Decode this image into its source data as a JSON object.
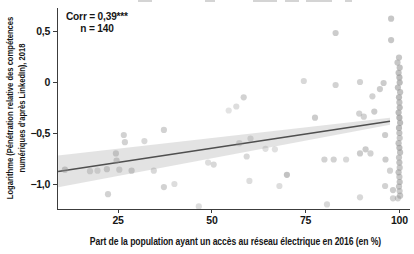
{
  "annotation": {
    "corr_label": "Corr = 0,39***",
    "n_label": "n = 140"
  },
  "axes": {
    "x_title": "Part de la population ayant un accès au réseau électrique en 2016 (en %)",
    "y_title_lines": [
      "Logarithme (Pénétration relative des compétences",
      "numériques d'après LinkedIn), 2018"
    ]
  },
  "chart_data": {
    "type": "scatter",
    "title": "",
    "xlabel": "Part de la population ayant un accès au réseau électrique en 2016 (en %)",
    "ylabel": "Logarithme (Pénétration relative des compétences numériques d'après LinkedIn), 2018",
    "xlim": [
      8.7,
      103.9
    ],
    "ylim": [
      -1.245,
      0.725
    ],
    "x_ticks": [
      25,
      50,
      75,
      100
    ],
    "x_tick_labels": [
      "25",
      "50",
      "75",
      "100"
    ],
    "y_ticks": [
      0.5,
      0,
      -0.5,
      -1
    ],
    "y_tick_labels": [
      "0,5",
      "0",
      "−0,5",
      "−1,0"
    ],
    "grid": false,
    "legend": "none",
    "correlation": "0,39***",
    "n": 140,
    "regression": {
      "x": [
        9,
        97.5
      ],
      "y": [
        -0.877,
        -0.385
      ],
      "band_upper": [
        -0.722,
        -0.35
      ],
      "band_lower": [
        -1.032,
        -0.42
      ]
    },
    "colors": {
      "point": "#8f8f8f",
      "line": "#4f4f4f",
      "band": "#dcdcdc",
      "axis": "#3c3c3c",
      "text": "#161616"
    },
    "points": [
      [
        97.8,
        0.62,
        0.5
      ],
      [
        83,
        0.48,
        0.45
      ],
      [
        97.8,
        0.41,
        0.5
      ],
      [
        58.5,
        -0.15,
        0.4
      ],
      [
        56.5,
        -0.24,
        0.3
      ],
      [
        74.5,
        0.01,
        0.35
      ],
      [
        83,
        -0.03,
        0.4
      ],
      [
        89.5,
        0.0,
        0.4
      ],
      [
        95.8,
        -0.01,
        0.45
      ],
      [
        94.8,
        -0.07,
        0.45
      ],
      [
        92.8,
        -0.14,
        0.4
      ],
      [
        77.5,
        -0.35,
        0.45
      ],
      [
        89.3,
        -0.31,
        0.4
      ],
      [
        93.3,
        -0.29,
        0.45
      ],
      [
        90.5,
        -0.34,
        0.4
      ],
      [
        96.2,
        -0.52,
        0.45
      ],
      [
        26.5,
        -0.52,
        0.4
      ],
      [
        26.8,
        -0.59,
        0.4
      ],
      [
        32,
        -0.58,
        0.35
      ],
      [
        37.2,
        -0.47,
        0.4
      ],
      [
        24.4,
        -0.7,
        0.4
      ],
      [
        24.6,
        -0.77,
        0.4
      ],
      [
        10.8,
        -0.86,
        0.45
      ],
      [
        22,
        -0.855,
        0.4
      ],
      [
        25.3,
        -0.86,
        0.35
      ],
      [
        28.6,
        -0.87,
        0.4
      ],
      [
        34.5,
        -0.87,
        0.35
      ],
      [
        40,
        -1.0,
        0.3
      ],
      [
        37.2,
        -1.03,
        0.4
      ],
      [
        22.3,
        -1.1,
        0.4
      ],
      [
        54.5,
        -0.28,
        0.25
      ],
      [
        59.3,
        -0.73,
        0.35
      ],
      [
        49,
        -0.79,
        0.3
      ],
      [
        50.5,
        -0.81,
        0.35
      ],
      [
        70,
        -0.91,
        0.55
      ],
      [
        60,
        -0.97,
        0.3
      ],
      [
        46.5,
        -1.22,
        0.3
      ],
      [
        68,
        -1.02,
        0.3
      ],
      [
        80.7,
        -1.2,
        0.35
      ],
      [
        80,
        -0.76,
        0.4
      ],
      [
        82.5,
        -0.76,
        0.4
      ],
      [
        85.8,
        -0.76,
        0.35
      ],
      [
        89.5,
        -0.7,
        0.45
      ],
      [
        91,
        -0.66,
        0.45
      ],
      [
        92.3,
        -0.7,
        0.4
      ],
      [
        96.3,
        -0.76,
        0.45
      ],
      [
        97.5,
        -0.87,
        0.4
      ],
      [
        96.2,
        -1.02,
        0.4
      ],
      [
        98.3,
        -1.06,
        0.45
      ],
      [
        98.3,
        -1.14,
        0.4
      ],
      [
        89.5,
        -1.13,
        0.35
      ],
      [
        57.3,
        -0.6,
        0.3
      ],
      [
        60.3,
        -0.555,
        0.3
      ],
      [
        64.3,
        -0.655,
        0.28
      ],
      [
        66.8,
        -0.66,
        0.28
      ],
      [
        17.5,
        -0.875,
        0.35
      ],
      [
        19.5,
        -0.87,
        0.3
      ],
      [
        99.9,
        0.24,
        0.5
      ],
      [
        99.5,
        0.19,
        0.5
      ],
      [
        100.1,
        0.14,
        0.55
      ],
      [
        99.8,
        0.09,
        0.55
      ],
      [
        100,
        0.045,
        0.6
      ],
      [
        100.1,
        -0.005,
        0.6
      ],
      [
        99.6,
        -0.055,
        0.55
      ],
      [
        100.2,
        -0.1,
        0.55
      ],
      [
        99.9,
        -0.15,
        0.6
      ],
      [
        100,
        -0.2,
        0.55
      ],
      [
        100.1,
        -0.25,
        0.6
      ],
      [
        99.8,
        -0.3,
        0.6
      ],
      [
        100,
        -0.35,
        0.65
      ],
      [
        100.2,
        -0.4,
        0.6
      ],
      [
        99.9,
        -0.45,
        0.6
      ],
      [
        100,
        -0.5,
        0.55
      ],
      [
        100.1,
        -0.55,
        0.5
      ],
      [
        99.8,
        -0.6,
        0.55
      ],
      [
        100,
        -0.645,
        0.6
      ],
      [
        100.2,
        -0.69,
        0.55
      ],
      [
        99.9,
        -0.74,
        0.5
      ],
      [
        100,
        -0.79,
        0.55
      ],
      [
        100.1,
        -0.84,
        0.5
      ],
      [
        99.8,
        -0.885,
        0.55
      ],
      [
        100,
        -0.93,
        0.5
      ],
      [
        100.1,
        -0.98,
        0.55
      ],
      [
        99.9,
        -1.025,
        0.5
      ],
      [
        100.05,
        -1.07,
        0.45
      ],
      [
        100.2,
        -1.115,
        0.5
      ],
      [
        99.6,
        -1.14,
        0.4
      ]
    ]
  }
}
